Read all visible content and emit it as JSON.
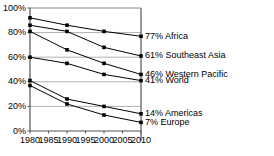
{
  "chart_data": {
    "type": "line",
    "title": "",
    "subtitle": "",
    "xlabel": "",
    "ylabel": "",
    "x": [
      1980,
      1990,
      2000,
      2010
    ],
    "xtick_labels": [
      "1980",
      "1985",
      "1990",
      "1995",
      "2000",
      "2005",
      "2010"
    ],
    "xticks": [
      1980,
      1985,
      1990,
      1995,
      2000,
      2005,
      2010
    ],
    "xlim": [
      1980,
      2010
    ],
    "ylim": [
      0,
      100
    ],
    "yticks": [
      0,
      20,
      40,
      60,
      80,
      100
    ],
    "ytick_labels": [
      "0%",
      "20%",
      "40%",
      "60%",
      "80%",
      "100%"
    ],
    "grid": true,
    "grid_axis": "y",
    "legend": "right-end-labels",
    "marker": "filled-square",
    "line_color": "#000000",
    "grid_color": "#b0b0b0",
    "axis_color": "#555555",
    "series": [
      {
        "name": "Africa",
        "end_label": "77% Africa",
        "values": [
          92,
          86,
          81,
          77
        ]
      },
      {
        "name": "Southeast Asia",
        "end_label": "61% Southeast Asia",
        "values": [
          86,
          81,
          68,
          61
        ]
      },
      {
        "name": "Western Pacific",
        "end_label": "46% Western Pacific",
        "values": [
          81,
          66,
          55,
          46
        ]
      },
      {
        "name": "World",
        "end_label": "41% World",
        "values": [
          60,
          55,
          46,
          41
        ]
      },
      {
        "name": "Americas",
        "end_label": "14% Americas",
        "values": [
          41,
          26,
          20,
          14
        ]
      },
      {
        "name": "Europe",
        "end_label": "7% Europe",
        "values": [
          37,
          22,
          13,
          7
        ]
      }
    ]
  }
}
